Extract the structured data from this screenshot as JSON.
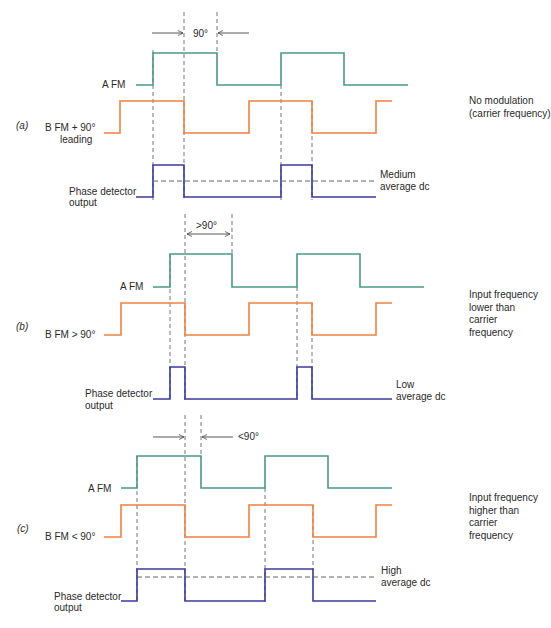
{
  "figure": {
    "colors": {
      "signal_a": "#4a9a86",
      "signal_b": "#f08040",
      "detector": "#3a3aa0",
      "dashed": "#555555",
      "avg_low_start": "#c060d0"
    },
    "panels": [
      {
        "id": "a",
        "tag": "(a)",
        "signal_a_label": "A   FM",
        "signal_b_label": "B   FM + 90°",
        "signal_b_sublabel": "leading",
        "detector_label": "Phase detector",
        "detector_sublabel": "output",
        "phase_label": "90°",
        "average_label_1": "Medium",
        "average_label_2": "average dc",
        "condition": "No modulation\n(carrier frequency)"
      },
      {
        "id": "b",
        "tag": "(b)",
        "signal_a_label": "A   FM",
        "signal_b_label": "B   FM > 90°",
        "detector_label": "Phase detector",
        "detector_sublabel": "output",
        "phase_label": ">90°",
        "average_label_1": "Low",
        "average_label_2": "average dc",
        "condition": "Input frequency\nlower than\ncarrier\nfrequency"
      },
      {
        "id": "c",
        "tag": "(c)",
        "signal_a_label": "A   FM",
        "signal_b_label": "B   FM < 90°",
        "detector_label": "Phase detector",
        "detector_sublabel": "output",
        "phase_label": "<90°",
        "average_label_1": "High",
        "average_label_2": "average dc",
        "condition": "Input frequency\nhigher than\ncarrier\nfrequency"
      }
    ]
  }
}
